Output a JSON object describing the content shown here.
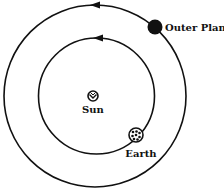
{
  "diagram": {
    "title": "",
    "colors": {
      "line": "#111111",
      "background": "#ffffff"
    },
    "orbits": [
      {
        "name": "outer-orbit",
        "direction": "counterclockwise"
      },
      {
        "name": "earth-orbit",
        "direction": "counterclockwise"
      }
    ],
    "bodies": {
      "sun": {
        "label": "Sun",
        "icon": "sun-icon"
      },
      "earth": {
        "label": "Earth",
        "icon": "earth-icon"
      },
      "outer_planet": {
        "label": "Outer Planet",
        "icon": "outer-planet-icon"
      }
    }
  }
}
